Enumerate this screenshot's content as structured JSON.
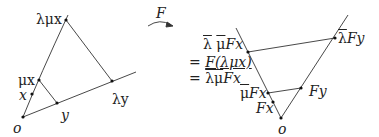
{
  "diagram": {
    "stroke_color": "#333333",
    "point_color": "#111111",
    "left": {
      "points": {
        "o": {
          "label": "o",
          "x": 23,
          "y": 117
        },
        "x": {
          "label": "x",
          "x": 32,
          "y": 94
        },
        "mu_x": {
          "label": "μx",
          "x": 39,
          "y": 80
        },
        "lambda_mu_x": {
          "label": "λμx",
          "x": 66,
          "y": 20
        },
        "y": {
          "label": "y",
          "x": 57,
          "y": 103
        },
        "lambda_y": {
          "label": "λy",
          "x": 112,
          "y": 81
        }
      }
    },
    "arrow": {
      "label": "F"
    },
    "right": {
      "points": {
        "o": {
          "label": "o"
        },
        "Fx": {
          "label": "Fx"
        },
        "mubar_Fx": {
          "bar": "μ",
          "rest": "Fx"
        },
        "lambdabar_Fy": {
          "bar": "λ",
          "rest": "Fy"
        },
        "Fy": {
          "label": "Fy"
        }
      },
      "equation": {
        "line1": {
          "lambda_bar": "λ",
          "mu_bar": "μ",
          "rest": "Fx"
        },
        "line2": {
          "prefix": "= ",
          "expr": "F(λμx)"
        },
        "line3": {
          "prefix": "= ",
          "lambdamu_bar": "λμ",
          "rest": "Fx"
        }
      }
    }
  }
}
